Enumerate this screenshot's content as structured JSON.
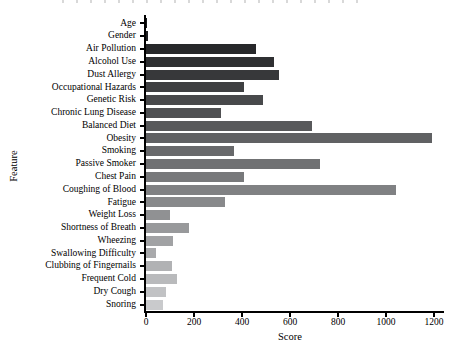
{
  "figure": {
    "background": "#ffffff",
    "axis_color": "#000000"
  },
  "chart_data": {
    "type": "bar",
    "orientation": "horizontal",
    "title": "",
    "xlabel": "Score",
    "ylabel": "Feature",
    "xlim": [
      0,
      1260
    ],
    "xticks": [
      0,
      200,
      400,
      600,
      800,
      1000,
      1200
    ],
    "grid": false,
    "legend": null,
    "categories": [
      "Age",
      "Gender",
      "Air Pollution",
      "Alcohol Use",
      "Dust Allergy",
      "Occupational Hazards",
      "Genetic Risk",
      "Chronic Lung Disease",
      "Balanced Diet",
      "Obesity",
      "Smoking",
      "Passive Smoker",
      "Chest Pain",
      "Coughing of Blood",
      "Fatigue",
      "Weight Loss",
      "Shortness of Breath",
      "Wheezing",
      "Swallowing Difficulty",
      "Clubbing of Fingernails",
      "Frequent Cold",
      "Dry Cough",
      "Snoring"
    ],
    "values": [
      3,
      10,
      460,
      535,
      555,
      410,
      487,
      312,
      690,
      1190,
      365,
      725,
      408,
      1040,
      330,
      100,
      180,
      112,
      42,
      108,
      130,
      83,
      71
    ],
    "bar_colors": [
      "#17181a",
      "#1f2022",
      "#27282a",
      "#2f3032",
      "#37383a",
      "#3f4042",
      "#48494b",
      "#505153",
      "#58595b",
      "#606163",
      "#68696b",
      "#707173",
      "#78797b",
      "#808183",
      "#88898b",
      "#909193",
      "#98999b",
      "#a1a2a4",
      "#a9aaac",
      "#b1b2b4",
      "#b9babc",
      "#c1c2c4",
      "#c9cacc"
    ]
  }
}
